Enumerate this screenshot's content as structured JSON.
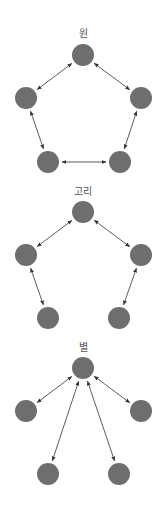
{
  "colors": {
    "node": "#6e6e6e",
    "edge": "#333333",
    "label": "#555555"
  },
  "diagrams": [
    {
      "label": "원",
      "label_pos": [
        83,
        37
      ],
      "nodes": [
        [
          83,
          55
        ],
        [
          26,
          98
        ],
        [
          141,
          98
        ],
        [
          48,
          162
        ],
        [
          120,
          162
        ]
      ],
      "edges": [
        [
          0,
          1
        ],
        [
          0,
          2
        ],
        [
          1,
          3
        ],
        [
          2,
          4
        ],
        [
          3,
          4
        ]
      ]
    },
    {
      "label": "고리",
      "label_pos": [
        83,
        195
      ],
      "nodes": [
        [
          83,
          212
        ],
        [
          26,
          255
        ],
        [
          141,
          255
        ],
        [
          48,
          318
        ],
        [
          119,
          318
        ]
      ],
      "edges": [
        [
          0,
          1
        ],
        [
          0,
          2
        ],
        [
          1,
          3
        ],
        [
          2,
          4
        ]
      ]
    },
    {
      "label": "별",
      "label_pos": [
        83,
        351
      ],
      "nodes": [
        [
          83,
          368
        ],
        [
          26,
          411
        ],
        [
          141,
          411
        ],
        [
          48,
          474
        ],
        [
          119,
          474
        ]
      ],
      "edges": [
        [
          0,
          1
        ],
        [
          0,
          2
        ],
        [
          0,
          3
        ],
        [
          0,
          4
        ]
      ]
    }
  ]
}
